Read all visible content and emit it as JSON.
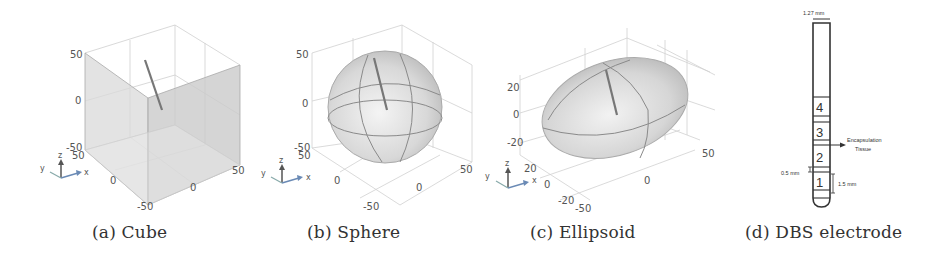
{
  "figure": {
    "panels": [
      {
        "id": "a",
        "caption": "(a) Cube",
        "shape": "cube",
        "z_ticks": [
          "50",
          "0",
          "-50"
        ],
        "y_ticks": [
          "50",
          "0",
          "-50"
        ],
        "x_ticks": [
          "-50",
          "0",
          "50"
        ],
        "triad": {
          "x": "x",
          "y": "y",
          "z": "z"
        }
      },
      {
        "id": "b",
        "caption": "(b) Sphere",
        "shape": "sphere",
        "z_ticks": [
          "50",
          "0",
          "-50"
        ],
        "y_ticks": [
          "50",
          "0",
          "-50"
        ],
        "x_ticks": [
          "-50",
          "0",
          "50"
        ],
        "triad": {
          "x": "x",
          "y": "y",
          "z": "z"
        }
      },
      {
        "id": "c",
        "caption": "(c) Ellipsoid",
        "shape": "ellipsoid",
        "z_ticks": [
          "20",
          "0",
          "-20"
        ],
        "y_ticks": [
          "20",
          "0",
          "-20"
        ],
        "x_ticks": [
          "-50",
          "0",
          "50"
        ],
        "triad": {
          "x": "x",
          "y": "y",
          "z": "z"
        }
      },
      {
        "id": "d",
        "caption": "(d) DBS electrode",
        "shape": "electrode",
        "labels": {
          "width": "1.27 mm",
          "gap": "0.5 mm",
          "contact_height": "1.5 mm",
          "encapsulation_line1": "Encapsulation",
          "encapsulation_line2": "Tissue"
        },
        "contacts": [
          "4",
          "3",
          "2",
          "1"
        ]
      }
    ]
  }
}
